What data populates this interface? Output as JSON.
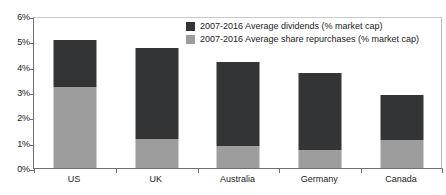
{
  "chart_data": {
    "type": "bar",
    "subtype": "stacked-bar",
    "title": "",
    "xlabel": "",
    "ylabel": "",
    "ylim": [
      0,
      6
    ],
    "ytick_values": [
      0,
      1,
      2,
      3,
      4,
      5,
      6
    ],
    "ytick_labels": [
      "0%",
      "1%",
      "2%",
      "3%",
      "4%",
      "5%",
      "6%"
    ],
    "grid": false,
    "legend_position": "inside-top-center",
    "units": "% market cap",
    "categories": [
      "US",
      "UK",
      "Australia",
      "Germany",
      "Canada"
    ],
    "series": [
      {
        "name": "2007-2016 Average share repurchases (% market cap)",
        "color": "#9d9d9d",
        "stack_order": 0,
        "values": [
          3.2,
          1.15,
          0.85,
          0.7,
          1.1
        ]
      },
      {
        "name": "2007-2016 Average dividends (% market cap)",
        "color": "#333436",
        "stack_order": 1,
        "values": [
          1.85,
          3.6,
          3.35,
          3.05,
          1.8
        ]
      }
    ],
    "totals": [
      5.05,
      4.75,
      4.2,
      3.75,
      2.9
    ]
  },
  "legend": {
    "items": [
      {
        "label": "2007-2016 Average dividends (% market cap)",
        "color": "#333436"
      },
      {
        "label": "2007-2016 Average share repurchases (% market cap)",
        "color": "#9d9d9d"
      }
    ]
  },
  "colors": {
    "dividends": "#333436",
    "repurchases": "#9d9d9d",
    "background": "#ffffff",
    "axis": "#6f6f6f"
  }
}
